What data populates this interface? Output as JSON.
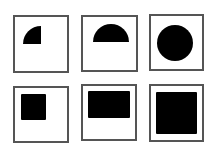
{
  "figure": {
    "background": "#ffffff",
    "border_color": "#555555",
    "fill_color": "#000000",
    "panels": [
      {
        "id": "panel-1",
        "row": 1,
        "col": 1,
        "frame": {
          "x": 13,
          "y": 15,
          "w": 56,
          "h": 58
        },
        "shape": "quarter-circle",
        "shape_geom": {
          "cx": 41,
          "cy": 44,
          "r": 18
        }
      },
      {
        "id": "panel-2",
        "row": 1,
        "col": 2,
        "frame": {
          "x": 81,
          "y": 15,
          "w": 57,
          "h": 57
        },
        "shape": "semicircle",
        "shape_geom": {
          "cx": 111,
          "cy": 42,
          "r": 18
        }
      },
      {
        "id": "panel-3",
        "row": 1,
        "col": 3,
        "frame": {
          "x": 149,
          "y": 14,
          "w": 55,
          "h": 57
        },
        "shape": "circle",
        "shape_geom": {
          "cx": 175,
          "cy": 43,
          "r": 18
        }
      },
      {
        "id": "panel-4",
        "row": 2,
        "col": 1,
        "frame": {
          "x": 13,
          "y": 86,
          "w": 56,
          "h": 57
        },
        "shape": "square",
        "shape_geom": {
          "x": 21,
          "y": 94,
          "w": 25,
          "h": 26
        }
      },
      {
        "id": "panel-5",
        "row": 2,
        "col": 2,
        "frame": {
          "x": 81,
          "y": 84,
          "w": 56,
          "h": 57
        },
        "shape": "rectangle",
        "shape_geom": {
          "x": 88,
          "y": 91,
          "w": 42,
          "h": 27
        }
      },
      {
        "id": "panel-6",
        "row": 2,
        "col": 3,
        "frame": {
          "x": 149,
          "y": 84,
          "w": 55,
          "h": 58
        },
        "shape": "square",
        "shape_geom": {
          "x": 156,
          "y": 92,
          "w": 41,
          "h": 42
        }
      }
    ]
  }
}
